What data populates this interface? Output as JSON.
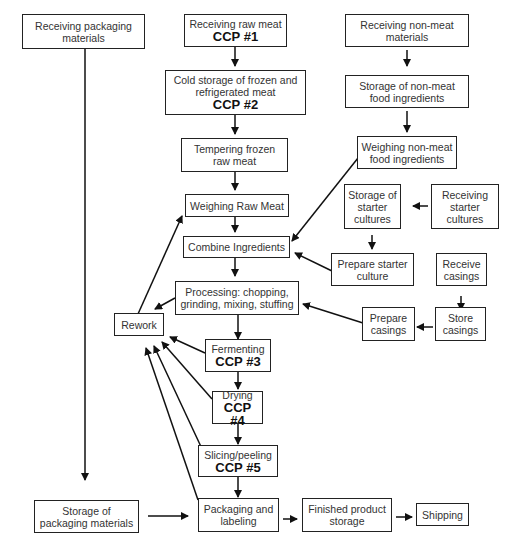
{
  "diagram": {
    "type": "flowchart",
    "nodes": {
      "receiving_packaging": {
        "label": "Receiving packaging materials",
        "ccp": ""
      },
      "receiving_raw_meat": {
        "label": "Receiving raw meat",
        "ccp": "CCP #1"
      },
      "cold_storage": {
        "label": "Cold storage of frozen and refrigerated meat",
        "ccp": "CCP #2"
      },
      "tempering": {
        "label": "Tempering frozen raw meat",
        "ccp": ""
      },
      "weighing_raw_meat": {
        "label": "Weighing Raw Meat",
        "ccp": ""
      },
      "combine_ingredients": {
        "label": "Combine Ingredients",
        "ccp": ""
      },
      "processing": {
        "label": "Processing: chopping, grinding, mixing, stuffing",
        "ccp": ""
      },
      "fermenting": {
        "label": "Fermenting",
        "ccp": "CCP #3"
      },
      "drying": {
        "label": "Drying",
        "ccp": "CCP #4"
      },
      "slicing": {
        "label": "Slicing/peeling",
        "ccp": "CCP #5"
      },
      "packaging_labeling": {
        "label": "Packaging and labeling",
        "ccp": ""
      },
      "finished_storage": {
        "label": "Finished product storage",
        "ccp": ""
      },
      "shipping": {
        "label": "Shipping",
        "ccp": ""
      },
      "rework": {
        "label": "Rework",
        "ccp": ""
      },
      "storage_packaging": {
        "label": "Storage of packaging materials",
        "ccp": ""
      },
      "receiving_nonmeat": {
        "label": "Receiving non-meat materials",
        "ccp": ""
      },
      "storage_nonmeat": {
        "label": "Storage of non-meat food ingredients",
        "ccp": ""
      },
      "weighing_nonmeat": {
        "label": "Weighing non-meat food ingredients",
        "ccp": ""
      },
      "storage_starter": {
        "label": "Storage of starter cultures",
        "ccp": ""
      },
      "receiving_starter": {
        "label": "Receiving starter cultures",
        "ccp": ""
      },
      "prepare_starter": {
        "label": "Prepare starter culture",
        "ccp": ""
      },
      "receive_casings": {
        "label": "Receive casings",
        "ccp": ""
      },
      "store_casings": {
        "label": "Store casings",
        "ccp": ""
      },
      "prepare_casings": {
        "label": "Prepare casings",
        "ccp": ""
      }
    },
    "edges": [
      [
        "receiving_raw_meat",
        "cold_storage"
      ],
      [
        "cold_storage",
        "tempering"
      ],
      [
        "tempering",
        "weighing_raw_meat"
      ],
      [
        "weighing_raw_meat",
        "combine_ingredients"
      ],
      [
        "combine_ingredients",
        "processing"
      ],
      [
        "processing",
        "fermenting"
      ],
      [
        "fermenting",
        "drying"
      ],
      [
        "drying",
        "slicing"
      ],
      [
        "slicing",
        "packaging_labeling"
      ],
      [
        "packaging_labeling",
        "finished_storage"
      ],
      [
        "finished_storage",
        "shipping"
      ],
      [
        "receiving_packaging",
        "storage_packaging"
      ],
      [
        "storage_packaging",
        "packaging_labeling"
      ],
      [
        "receiving_nonmeat",
        "storage_nonmeat"
      ],
      [
        "storage_nonmeat",
        "weighing_nonmeat"
      ],
      [
        "weighing_nonmeat",
        "combine_ingredients"
      ],
      [
        "receiving_starter",
        "storage_starter"
      ],
      [
        "storage_starter",
        "prepare_starter"
      ],
      [
        "prepare_starter",
        "combine_ingredients"
      ],
      [
        "receive_casings",
        "store_casings"
      ],
      [
        "store_casings",
        "prepare_casings"
      ],
      [
        "prepare_casings",
        "processing"
      ],
      [
        "processing",
        "rework"
      ],
      [
        "fermenting",
        "rework"
      ],
      [
        "drying",
        "rework"
      ],
      [
        "slicing",
        "rework"
      ],
      [
        "packaging_labeling",
        "rework"
      ],
      [
        "rework",
        "weighing_raw_meat"
      ]
    ]
  }
}
